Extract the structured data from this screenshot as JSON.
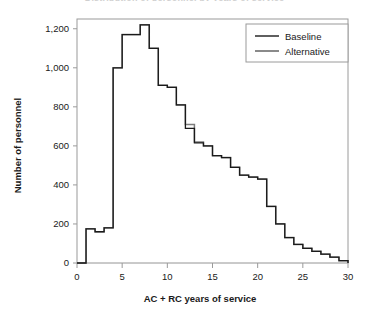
{
  "figure": {
    "title_clipped": "Distribution of personnel by years of service",
    "background_color": "#ffffff"
  },
  "chart_data": {
    "type": "line",
    "render": "step",
    "title": "",
    "xlabel": "AC + RC years of service",
    "ylabel": "Number of personnel",
    "xlim": [
      0,
      30
    ],
    "ylim": [
      0,
      1250
    ],
    "xticks": [
      0,
      5,
      10,
      15,
      20,
      25,
      30
    ],
    "xtick_labels": [
      "0",
      "5",
      "10",
      "15",
      "20",
      "25",
      "30"
    ],
    "yticks": [
      0,
      200,
      400,
      600,
      800,
      1000,
      1200
    ],
    "ytick_labels": [
      "0",
      "200",
      "400",
      "600",
      "800",
      "1,000",
      "1,200"
    ],
    "grid": false,
    "legend_position": "top-right",
    "x": [
      0,
      1,
      2,
      3,
      4,
      5,
      6,
      7,
      8,
      9,
      10,
      11,
      12,
      13,
      14,
      15,
      16,
      17,
      18,
      19,
      20,
      21,
      22,
      23,
      24,
      25,
      26,
      27,
      28,
      29,
      30
    ],
    "series": [
      {
        "name": "Baseline",
        "color": "#1a1a1a",
        "values": [
          0,
          175,
          160,
          180,
          1000,
          1170,
          1170,
          1220,
          1100,
          910,
          900,
          810,
          690,
          615,
          600,
          550,
          540,
          490,
          450,
          440,
          430,
          290,
          200,
          130,
          95,
          75,
          60,
          45,
          30,
          12,
          0
        ]
      },
      {
        "name": "Alternative",
        "color": "#7d7d7d",
        "values": [
          0,
          175,
          160,
          180,
          1000,
          1170,
          1170,
          1220,
          1100,
          910,
          900,
          810,
          710,
          620,
          600,
          550,
          540,
          490,
          450,
          440,
          430,
          290,
          200,
          130,
          95,
          75,
          60,
          45,
          30,
          12,
          0
        ]
      }
    ]
  },
  "legend": {
    "entries": [
      {
        "label": "Baseline",
        "color": "#1a1a1a"
      },
      {
        "label": "Alternative",
        "color": "#7d7d7d"
      }
    ]
  },
  "axes": {
    "x_title": "AC + RC years of service",
    "y_title": "Number of personnel"
  }
}
